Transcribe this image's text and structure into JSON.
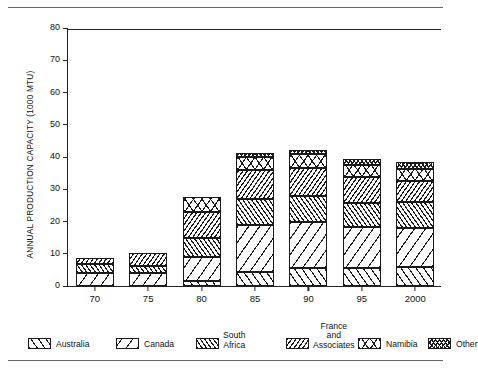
{
  "chart_data": {
    "type": "bar",
    "subtype": "stacked-bar",
    "title": "",
    "subtitle": "",
    "xlabel": "",
    "ylabel": "ANNUAL PRODUCTION CAPACITY (1000 MTU)",
    "categories": [
      "70",
      "75",
      "80",
      "85",
      "90",
      "95",
      "2000"
    ],
    "ylim": [
      0,
      80
    ],
    "yticks": [
      0,
      10,
      20,
      30,
      40,
      50,
      60,
      70,
      80
    ],
    "ytick_labels": [
      "0",
      "10",
      "20",
      "30",
      "40",
      "50",
      "60",
      "70",
      "80"
    ],
    "grid": false,
    "legend_position": "bottom",
    "series": [
      {
        "name": "Australia",
        "pattern": "diagonal-up-wide",
        "values": [
          0.0,
          0.0,
          1.7,
          4.5,
          5.5,
          5.5,
          5.8
        ]
      },
      {
        "name": "Canada",
        "pattern": "diagonal-down-wide",
        "values": [
          4.0,
          4.0,
          7.3,
          14.5,
          14.5,
          12.7,
          12.3
        ]
      },
      {
        "name": "South Africa",
        "pattern": "diagonal-up-dense",
        "values": [
          2.9,
          2.3,
          6.0,
          8.0,
          8.0,
          7.5,
          8.0
        ]
      },
      {
        "name": "France and Associates",
        "pattern": "diagonal-down-dense",
        "values": [
          1.9,
          3.9,
          8.0,
          9.0,
          8.7,
          8.0,
          6.5
        ]
      },
      {
        "name": "Namibia",
        "pattern": "crosshatch-wide",
        "values": [
          0.0,
          0.0,
          4.5,
          4.0,
          4.1,
          3.8,
          3.8
        ]
      },
      {
        "name": "Other",
        "pattern": "crosshatch-dense",
        "values": [
          0.0,
          0.0,
          0.0,
          1.3,
          1.5,
          2.0,
          2.2
        ]
      }
    ],
    "totals": [
      8.8,
      10.2,
      27.5,
      41.3,
      42.3,
      39.5,
      38.6
    ]
  },
  "legend": {
    "items": [
      {
        "label": "Australia",
        "label_lines": [
          "Australia"
        ],
        "swatch": "pat-australia",
        "multiline": false
      },
      {
        "label": "Canada",
        "label_lines": [
          "Canada"
        ],
        "swatch": "pat-canada",
        "multiline": false
      },
      {
        "label": "South Africa",
        "label_lines": [
          "South",
          "Africa"
        ],
        "swatch": "pat-southafrica",
        "multiline": true
      },
      {
        "label": "France and Associates",
        "label_lines": [
          "France",
          "and",
          "Associates"
        ],
        "swatch": "pat-france",
        "multiline": true
      },
      {
        "label": "Namibia",
        "label_lines": [
          "Namibia"
        ],
        "swatch": "pat-namibia",
        "multiline": false
      },
      {
        "label": "Other",
        "label_lines": [
          "Other"
        ],
        "swatch": "pat-other",
        "multiline": false
      }
    ]
  },
  "colors": {
    "ink": "#1a1a1a",
    "axis": "#222222",
    "rule": "#666666",
    "background": "#ffffff"
  }
}
